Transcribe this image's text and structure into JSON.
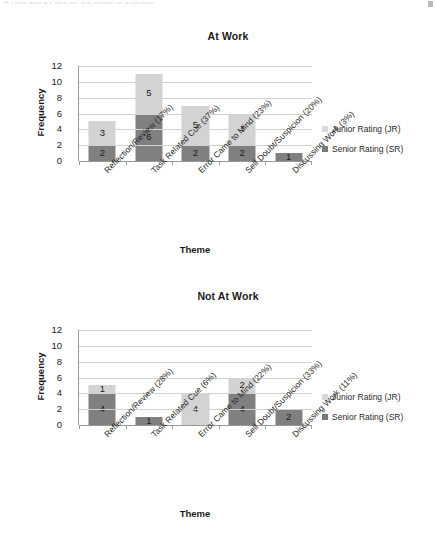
{
  "page": {
    "top_text_fragment": "A Time and a Place for the Recall of a Details"
  },
  "legend": {
    "junior_label": "Junior Rating (JR)",
    "senior_label": "Senior Rating (SR)",
    "junior_color": "#d3d3d3",
    "senior_color": "#808080"
  },
  "chart_data": [
    {
      "type": "bar",
      "id": "at-work",
      "title": "At Work",
      "xlabel": "Theme",
      "ylabel": "Frequency",
      "ylim": [
        0,
        12
      ],
      "yticks": [
        0,
        2,
        4,
        6,
        8,
        10,
        12
      ],
      "grid": true,
      "stacked": true,
      "legend_position": "right",
      "categories": [
        "Reflection/Review (17%)",
        "Task Related Cue (37%)",
        "Error Came to Mind (23%)",
        "Self Doubt/Suspicion (20%)",
        "Discussing Work (3%)"
      ],
      "series": [
        {
          "name": "Senior Rating (SR)",
          "color": "#808080",
          "values": [
            2,
            6,
            2,
            2,
            1
          ]
        },
        {
          "name": "Junior Rating (JR)",
          "color": "#d3d3d3",
          "values": [
            3,
            5,
            5,
            4,
            0
          ]
        }
      ],
      "totals": [
        5,
        11,
        7,
        6,
        1
      ]
    },
    {
      "type": "bar",
      "id": "not-at-work",
      "title": "Not At Work",
      "xlabel": "Theme",
      "ylabel": "Frequency",
      "ylim": [
        0,
        12
      ],
      "yticks": [
        0,
        2,
        4,
        6,
        8,
        10,
        12
      ],
      "grid": true,
      "stacked": true,
      "legend_position": "right",
      "categories": [
        "Reflection/Review (28%)",
        "Task Related Cue (6%)",
        "Error Came to Mind (22%)",
        "Self Doubt/Suspicion (33%)",
        "Discussing Work (11%)"
      ],
      "series": [
        {
          "name": "Senior Rating (SR)",
          "color": "#808080",
          "values": [
            4,
            1,
            0,
            4,
            2
          ]
        },
        {
          "name": "Junior Rating (JR)",
          "color": "#d3d3d3",
          "values": [
            1,
            0,
            4,
            2,
            0
          ]
        }
      ],
      "totals": [
        5,
        1,
        4,
        6,
        2
      ]
    }
  ]
}
